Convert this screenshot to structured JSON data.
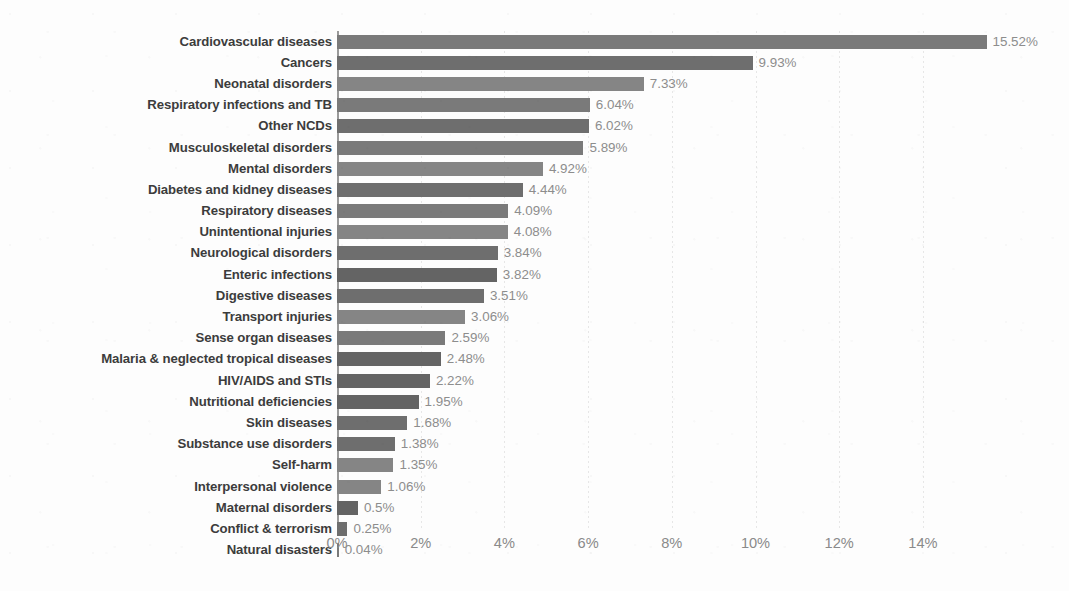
{
  "chart_data": {
    "type": "bar",
    "orientation": "horizontal",
    "title": "",
    "subtitle": "",
    "xlabel": "",
    "ylabel": "",
    "xlim": [
      0,
      15.9
    ],
    "grid": true,
    "grid_axis": "x",
    "legend": false,
    "value_suffix": "%",
    "axis_ticks": [
      "0%",
      "2%",
      "4%",
      "6%",
      "8%",
      "10%",
      "12%",
      "14%"
    ],
    "axis_tick_values": [
      0,
      2,
      4,
      6,
      8,
      10,
      12,
      14
    ],
    "categories": [
      "Cardiovascular diseases",
      "Cancers",
      "Neonatal disorders",
      "Respiratory infections and TB",
      "Other NCDs",
      "Musculoskeletal disorders",
      "Mental disorders",
      "Diabetes and kidney diseases",
      "Respiratory diseases",
      "Unintentional injuries",
      "Neurological disorders",
      "Enteric infections",
      "Digestive diseases",
      "Transport injuries",
      "Sense organ diseases",
      "Malaria & neglected tropical diseases",
      "HIV/AIDS and STIs",
      "Nutritional deficiencies",
      "Skin diseases",
      "Substance use disorders",
      "Self-harm",
      "Interpersonal violence",
      "Maternal disorders",
      "Conflict & terrorism",
      "Natural disasters"
    ],
    "values": [
      15.52,
      9.93,
      7.33,
      6.04,
      6.02,
      5.89,
      4.92,
      4.44,
      4.09,
      4.08,
      3.84,
      3.82,
      3.51,
      3.06,
      2.59,
      2.48,
      2.22,
      1.95,
      1.68,
      1.38,
      1.35,
      1.06,
      0.5,
      0.25,
      0.04
    ],
    "value_labels": [
      "15.52%",
      "9.93%",
      "7.33%",
      "6.04%",
      "6.02%",
      "5.89%",
      "4.92%",
      "4.44%",
      "4.09%",
      "4.08%",
      "3.84%",
      "3.82%",
      "3.51%",
      "3.06%",
      "2.59%",
      "2.48%",
      "2.22%",
      "1.95%",
      "1.68%",
      "1.38%",
      "1.35%",
      "1.06%",
      "0.5%",
      "0.25%",
      "0.04%"
    ]
  },
  "colors": {
    "bar": "#777777",
    "background": "#fdfdfd",
    "category_text": "#3c3c3c",
    "value_text": "#8d8d8d",
    "axis": "#9a9a9a",
    "gridline": "#8c8c8c"
  }
}
